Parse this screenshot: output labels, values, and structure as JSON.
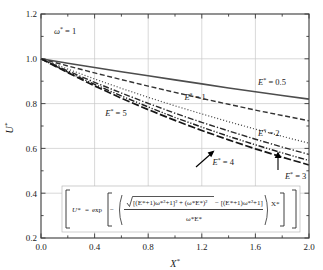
{
  "chart_data": {
    "type": "line",
    "title": "",
    "xlabel": "X*",
    "ylabel": "U*",
    "xlim": [
      0.0,
      2.0
    ],
    "ylim": [
      0.2,
      1.2
    ],
    "xticks": [
      "0.0",
      "0.4",
      "0.8",
      "1.2",
      "1.6",
      "2.0"
    ],
    "xtick_values": [
      0.0,
      0.4,
      0.8,
      1.2,
      1.6,
      2.0
    ],
    "yticks": [
      "0.2",
      "0.4",
      "0.6",
      "0.8",
      "1.0",
      "1.2"
    ],
    "ytick_values": [
      0.2,
      0.4,
      0.6,
      0.8,
      1.0,
      1.2
    ],
    "minor_ticks": true,
    "grid": "major-gridlines-light-gray",
    "legend": "inline-curve-labels",
    "annotations": [
      {
        "name": "omega-annotation",
        "text": "ω* = 1",
        "x": 0.22,
        "y": 1.115
      },
      {
        "name": "equation-box",
        "text": "U* = exp[ − ( ( √{[(E*+1)ω*²+1]² + (ω*E*)²} − [(E*+1)ω*²+1] ) / (ω*E*) ) X* ]"
      }
    ],
    "formula": {
      "lhs": "U*",
      "eq": "=",
      "exp": "exp",
      "minus": "−",
      "num_radical_inner": "[(E*+1)ω*²+1]² + (ω*E*)²",
      "num_tail": "− [(E*+1)ω*²+1]",
      "denominator": "ω*E*",
      "trailing": "X*"
    },
    "series": [
      {
        "name": "E* = 0.5",
        "label": "E* = 0.5",
        "E": 0.5,
        "decay_k": 0.099,
        "dash": "solid",
        "color": "#4d4d4d",
        "width": 1.6,
        "x": [
          0.0,
          0.2,
          0.4,
          0.6,
          0.8,
          1.0,
          1.2,
          1.4,
          1.6,
          1.8,
          2.0
        ],
        "y": [
          1.0,
          0.98,
          0.961,
          0.942,
          0.924,
          0.906,
          0.888,
          0.87,
          0.853,
          0.836,
          0.82
        ],
        "label_x": 1.62,
        "label_y": 0.885
      },
      {
        "name": "E* = 1",
        "label": "E* = 1",
        "E": 1,
        "decay_k": 0.1623,
        "dash": "dash",
        "color": "#333333",
        "width": 1.4,
        "x": [
          0.0,
          0.2,
          0.4,
          0.6,
          0.8,
          1.0,
          1.2,
          1.4,
          1.6,
          1.8,
          2.0
        ],
        "y": [
          1.0,
          0.968,
          0.937,
          0.907,
          0.878,
          0.85,
          0.823,
          0.797,
          0.771,
          0.747,
          0.723
        ],
        "label_x": 1.07,
        "label_y": 0.815
      },
      {
        "name": "E* = 2",
        "label": "E* = 2",
        "E": 2,
        "decay_k": 0.2361,
        "dash": "dot",
        "color": "#4d4d4d",
        "width": 1.2,
        "x": [
          0.0,
          0.2,
          0.4,
          0.6,
          0.8,
          1.0,
          1.2,
          1.4,
          1.6,
          1.8,
          2.0
        ],
        "y": [
          1.0,
          0.954,
          0.91,
          0.868,
          0.828,
          0.79,
          0.754,
          0.719,
          0.686,
          0.654,
          0.623
        ],
        "label_x": 1.62,
        "label_y": 0.655
      },
      {
        "name": "E* = 3",
        "label": "E* = 3",
        "E": 3,
        "decay_k": 0.2781,
        "dash": "dashdot",
        "color": "#2b2b2b",
        "width": 1.4,
        "x": [
          0.0,
          0.2,
          0.4,
          0.6,
          0.8,
          1.0,
          1.2,
          1.4,
          1.6,
          1.8,
          2.0
        ],
        "y": [
          1.0,
          0.946,
          0.895,
          0.847,
          0.801,
          0.757,
          0.716,
          0.678,
          0.641,
          0.606,
          0.573
        ],
        "label_x": 1.82,
        "label_y": 0.465
      },
      {
        "name": "E* = 4",
        "label": "E* = 4",
        "E": 4,
        "decay_k": 0.3028,
        "dash": "dashdotdot",
        "color": "#1f1f1f",
        "width": 1.4,
        "x": [
          0.0,
          0.2,
          0.4,
          0.6,
          0.8,
          1.0,
          1.2,
          1.4,
          1.6,
          1.8,
          2.0
        ],
        "y": [
          1.0,
          0.941,
          0.886,
          0.834,
          0.785,
          0.738,
          0.695,
          0.654,
          0.616,
          0.58,
          0.546
        ],
        "label_x": 1.28,
        "label_y": 0.525
      },
      {
        "name": "E* = 5",
        "label": "E* = 5",
        "E": 5,
        "decay_k": 0.3209,
        "dash": "longdash",
        "color": "#161616",
        "width": 1.7,
        "x": [
          0.0,
          0.2,
          0.4,
          0.6,
          0.8,
          1.0,
          1.2,
          1.4,
          1.6,
          1.8,
          2.0
        ],
        "y": [
          1.0,
          0.938,
          0.879,
          0.824,
          0.773,
          0.725,
          0.68,
          0.638,
          0.598,
          0.561,
          0.526
        ],
        "label_x": 0.48,
        "label_y": 0.745
      }
    ]
  },
  "axes": {
    "x_title": "X*",
    "y_title": "U*"
  }
}
